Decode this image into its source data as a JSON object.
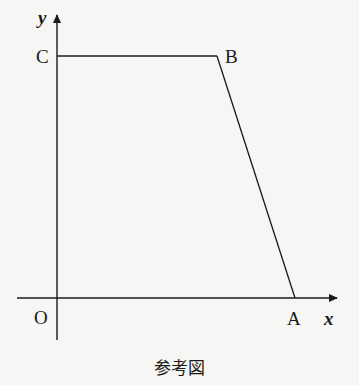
{
  "diagram": {
    "axes": {
      "x_label": "x",
      "y_label": "y",
      "origin_label": "O"
    },
    "points": [
      {
        "name": "C",
        "label": "C",
        "x": 57,
        "y": 56
      },
      {
        "name": "B",
        "label": "B",
        "x": 217,
        "y": 56
      },
      {
        "name": "A",
        "label": "A",
        "x": 295,
        "y": 298
      },
      {
        "name": "O",
        "label": "O",
        "x": 57,
        "y": 298
      }
    ],
    "segments": [
      [
        "C",
        "B"
      ],
      [
        "B",
        "A"
      ]
    ],
    "caption": "参考図",
    "line_color": "#1a1a1a"
  }
}
